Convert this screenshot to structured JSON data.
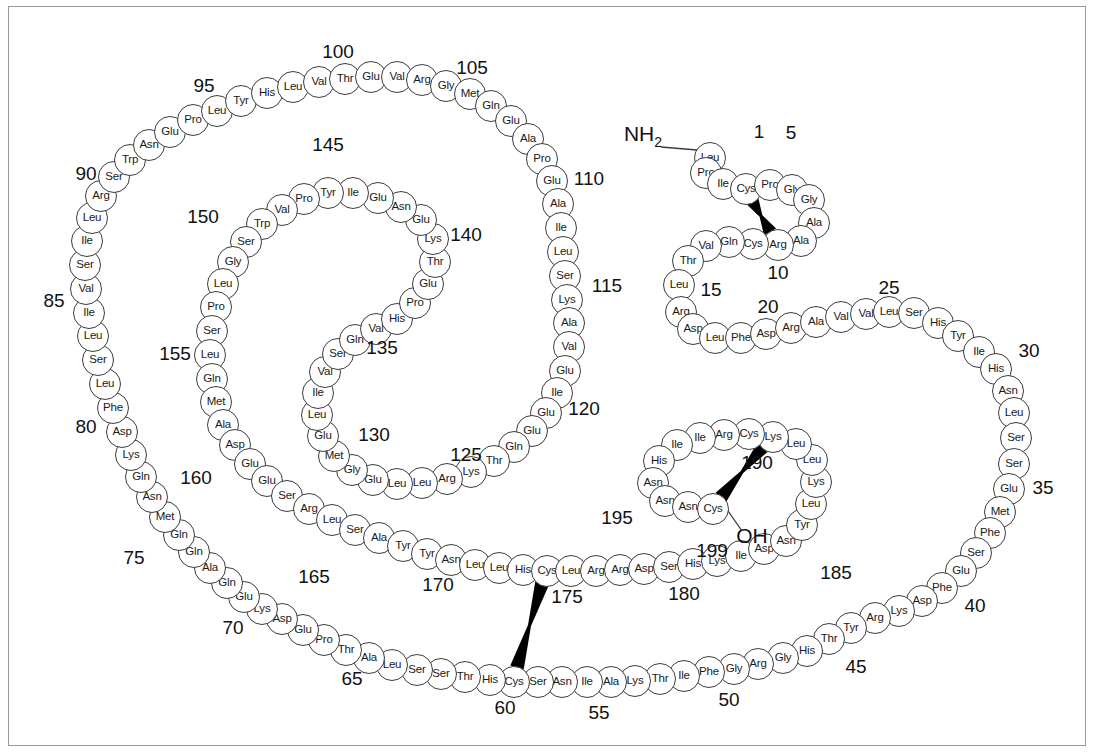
{
  "diagram": {
    "n_terminus_label": "NH2",
    "c_terminus_label": "OH",
    "residue_count": 199,
    "disulfide_bonds": [
      [
        4,
        10
      ],
      [
        58,
        174
      ],
      [
        190,
        199
      ]
    ],
    "stroke_color": "#3c3c3c",
    "bond_color": "#000000",
    "background": "#ffffff"
  },
  "sequence": [
    {
      "n": 1,
      "aa": "Leu",
      "x": 709,
      "y": 157
    },
    {
      "n": 2,
      "aa": "Pro",
      "x": 705,
      "y": 172
    },
    {
      "n": 3,
      "aa": "Ile",
      "x": 722,
      "y": 183
    },
    {
      "n": 4,
      "aa": "Cys",
      "x": 745,
      "y": 188
    },
    {
      "n": 5,
      "aa": "Pro",
      "x": 769,
      "y": 184
    },
    {
      "n": 6,
      "aa": "Gly",
      "x": 791,
      "y": 189
    },
    {
      "n": 7,
      "aa": "Gly",
      "x": 808,
      "y": 199
    },
    {
      "n": 8,
      "aa": "Ala",
      "x": 813,
      "y": 222
    },
    {
      "n": 9,
      "aa": "Ala",
      "x": 800,
      "y": 240
    },
    {
      "n": 10,
      "aa": "Arg",
      "x": 777,
      "y": 244
    },
    {
      "n": 11,
      "aa": "Cys",
      "x": 752,
      "y": 243
    },
    {
      "n": 12,
      "aa": "Gln",
      "x": 728,
      "y": 241
    },
    {
      "n": 13,
      "aa": "Val",
      "x": 705,
      "y": 245
    },
    {
      "n": 14,
      "aa": "Thr",
      "x": 687,
      "y": 260
    },
    {
      "n": 15,
      "aa": "Leu",
      "x": 678,
      "y": 284
    },
    {
      "n": 16,
      "aa": "Arg",
      "x": 680,
      "y": 311
    },
    {
      "n": 17,
      "aa": "Asp",
      "x": 692,
      "y": 328
    },
    {
      "n": 18,
      "aa": "Leu",
      "x": 714,
      "y": 337
    },
    {
      "n": 19,
      "aa": "Phe",
      "x": 740,
      "y": 337
    },
    {
      "n": 20,
      "aa": "Asp",
      "x": 765,
      "y": 333
    },
    {
      "n": 21,
      "aa": "Arg",
      "x": 790,
      "y": 327
    },
    {
      "n": 22,
      "aa": "Ala",
      "x": 815,
      "y": 321
    },
    {
      "n": 23,
      "aa": "Val",
      "x": 840,
      "y": 316
    },
    {
      "n": 24,
      "aa": "Val",
      "x": 865,
      "y": 313
    },
    {
      "n": 25,
      "aa": "Leu",
      "x": 888,
      "y": 311
    },
    {
      "n": 26,
      "aa": "Ser",
      "x": 913,
      "y": 312
    },
    {
      "n": 27,
      "aa": "His",
      "x": 937,
      "y": 322
    },
    {
      "n": 28,
      "aa": "Tyr",
      "x": 957,
      "y": 335
    },
    {
      "n": 29,
      "aa": "Ile",
      "x": 978,
      "y": 351
    },
    {
      "n": 30,
      "aa": "His",
      "x": 995,
      "y": 368
    },
    {
      "n": 31,
      "aa": "Asn",
      "x": 1007,
      "y": 390
    },
    {
      "n": 32,
      "aa": "Leu",
      "x": 1013,
      "y": 412
    },
    {
      "n": 33,
      "aa": "Ser",
      "x": 1015,
      "y": 437
    },
    {
      "n": 34,
      "aa": "Ser",
      "x": 1013,
      "y": 463
    },
    {
      "n": 35,
      "aa": "Glu",
      "x": 1008,
      "y": 488
    },
    {
      "n": 36,
      "aa": "Met",
      "x": 999,
      "y": 511
    },
    {
      "n": 37,
      "aa": "Phe",
      "x": 989,
      "y": 532
    },
    {
      "n": 38,
      "aa": "Ser",
      "x": 975,
      "y": 552
    },
    {
      "n": 39,
      "aa": "Glu",
      "x": 960,
      "y": 570
    },
    {
      "n": 40,
      "aa": "Phe",
      "x": 941,
      "y": 587
    },
    {
      "n": 41,
      "aa": "Asp",
      "x": 921,
      "y": 600
    },
    {
      "n": 42,
      "aa": "Lys",
      "x": 898,
      "y": 610
    },
    {
      "n": 43,
      "aa": "Arg",
      "x": 874,
      "y": 617
    },
    {
      "n": 44,
      "aa": "Tyr",
      "x": 850,
      "y": 627
    },
    {
      "n": 45,
      "aa": "Thr",
      "x": 828,
      "y": 638
    },
    {
      "n": 46,
      "aa": "His",
      "x": 806,
      "y": 650
    },
    {
      "n": 47,
      "aa": "Gly",
      "x": 782,
      "y": 657
    },
    {
      "n": 48,
      "aa": "Arg",
      "x": 757,
      "y": 663
    },
    {
      "n": 49,
      "aa": "Gly",
      "x": 733,
      "y": 668
    },
    {
      "n": 50,
      "aa": "Phe",
      "x": 708,
      "y": 671
    },
    {
      "n": 51,
      "aa": "Ile",
      "x": 683,
      "y": 675
    },
    {
      "n": 52,
      "aa": "Thr",
      "x": 659,
      "y": 678
    },
    {
      "n": 53,
      "aa": "Lys",
      "x": 634,
      "y": 680
    },
    {
      "n": 54,
      "aa": "Ala",
      "x": 610,
      "y": 681
    },
    {
      "n": 55,
      "aa": "Ile",
      "x": 586,
      "y": 681
    },
    {
      "n": 56,
      "aa": "Asn",
      "x": 561,
      "y": 681
    },
    {
      "n": 57,
      "aa": "Ser",
      "x": 537,
      "y": 681
    },
    {
      "n": 58,
      "aa": "Cys",
      "x": 513,
      "y": 681
    },
    {
      "n": 59,
      "aa": "His",
      "x": 489,
      "y": 679
    },
    {
      "n": 60,
      "aa": "Thr",
      "x": 464,
      "y": 676
    },
    {
      "n": 61,
      "aa": "Ser",
      "x": 440,
      "y": 673
    },
    {
      "n": 62,
      "aa": "Ser",
      "x": 416,
      "y": 669
    },
    {
      "n": 63,
      "aa": "Leu",
      "x": 391,
      "y": 664
    },
    {
      "n": 64,
      "aa": "Ala",
      "x": 368,
      "y": 657
    },
    {
      "n": 65,
      "aa": "Thr",
      "x": 345,
      "y": 649
    },
    {
      "n": 66,
      "aa": "Pro",
      "x": 323,
      "y": 639
    },
    {
      "n": 67,
      "aa": "Glu",
      "x": 302,
      "y": 629
    },
    {
      "n": 68,
      "aa": "Asp",
      "x": 281,
      "y": 618
    },
    {
      "n": 69,
      "aa": "Lys",
      "x": 261,
      "y": 608
    },
    {
      "n": 70,
      "aa": "Glu",
      "x": 243,
      "y": 596
    },
    {
      "n": 71,
      "aa": "Gln",
      "x": 226,
      "y": 582
    },
    {
      "n": 72,
      "aa": "Ala",
      "x": 209,
      "y": 567
    },
    {
      "n": 73,
      "aa": "Gln",
      "x": 193,
      "y": 551
    },
    {
      "n": 74,
      "aa": "Gln",
      "x": 178,
      "y": 534
    },
    {
      "n": 75,
      "aa": "Met",
      "x": 164,
      "y": 516
    },
    {
      "n": 76,
      "aa": "Asn",
      "x": 151,
      "y": 496
    },
    {
      "n": 77,
      "aa": "Gln",
      "x": 140,
      "y": 476
    },
    {
      "n": 78,
      "aa": "Lys",
      "x": 130,
      "y": 454
    },
    {
      "n": 79,
      "aa": "Asp",
      "x": 121,
      "y": 431
    },
    {
      "n": 80,
      "aa": "Phe",
      "x": 112,
      "y": 407
    },
    {
      "n": 81,
      "aa": "Leu",
      "x": 104,
      "y": 383
    },
    {
      "n": 82,
      "aa": "Ser",
      "x": 97,
      "y": 359
    },
    {
      "n": 83,
      "aa": "Leu",
      "x": 92,
      "y": 335
    },
    {
      "n": 84,
      "aa": "Ile",
      "x": 88,
      "y": 312
    },
    {
      "n": 85,
      "aa": "Val",
      "x": 85,
      "y": 288
    },
    {
      "n": 86,
      "aa": "Ser",
      "x": 84,
      "y": 264
    },
    {
      "n": 87,
      "aa": "Ile",
      "x": 86,
      "y": 240
    },
    {
      "n": 88,
      "aa": "Leu",
      "x": 91,
      "y": 217
    },
    {
      "n": 89,
      "aa": "Arg",
      "x": 100,
      "y": 195
    },
    {
      "n": 90,
      "aa": "Ser",
      "x": 113,
      "y": 176
    },
    {
      "n": 91,
      "aa": "Trp",
      "x": 129,
      "y": 159
    },
    {
      "n": 92,
      "aa": "Asn",
      "x": 148,
      "y": 144
    },
    {
      "n": 93,
      "aa": "Glu",
      "x": 169,
      "y": 131
    },
    {
      "n": 94,
      "aa": "Pro",
      "x": 192,
      "y": 119
    },
    {
      "n": 95,
      "aa": "Leu",
      "x": 216,
      "y": 110
    },
    {
      "n": 96,
      "aa": "Tyr",
      "x": 240,
      "y": 100
    },
    {
      "n": 97,
      "aa": "His",
      "x": 266,
      "y": 92
    },
    {
      "n": 98,
      "aa": "Leu",
      "x": 292,
      "y": 86
    },
    {
      "n": 99,
      "aa": "Val",
      "x": 318,
      "y": 81
    },
    {
      "n": 100,
      "aa": "Thr",
      "x": 344,
      "y": 78
    },
    {
      "n": 101,
      "aa": "Glu",
      "x": 370,
      "y": 76
    },
    {
      "n": 102,
      "aa": "Val",
      "x": 396,
      "y": 76
    },
    {
      "n": 103,
      "aa": "Arg",
      "x": 421,
      "y": 79
    },
    {
      "n": 104,
      "aa": "Gly",
      "x": 445,
      "y": 85
    },
    {
      "n": 105,
      "aa": "Met",
      "x": 469,
      "y": 93
    },
    {
      "n": 106,
      "aa": "Gln",
      "x": 490,
      "y": 105
    },
    {
      "n": 107,
      "aa": "Glu",
      "x": 510,
      "y": 120
    },
    {
      "n": 108,
      "aa": "Ala",
      "x": 527,
      "y": 138
    },
    {
      "n": 109,
      "aa": "Pro",
      "x": 541,
      "y": 158
    },
    {
      "n": 110,
      "aa": "Glu",
      "x": 551,
      "y": 180
    },
    {
      "n": 111,
      "aa": "Ala",
      "x": 557,
      "y": 203
    },
    {
      "n": 112,
      "aa": "Ile",
      "x": 560,
      "y": 227
    },
    {
      "n": 113,
      "aa": "Leu",
      "x": 562,
      "y": 251
    },
    {
      "n": 114,
      "aa": "Ser",
      "x": 564,
      "y": 275
    },
    {
      "n": 115,
      "aa": "Lys",
      "x": 566,
      "y": 299
    },
    {
      "n": 116,
      "aa": "Ala",
      "x": 568,
      "y": 322
    },
    {
      "n": 117,
      "aa": "Val",
      "x": 568,
      "y": 346
    },
    {
      "n": 118,
      "aa": "Glu",
      "x": 564,
      "y": 370
    },
    {
      "n": 119,
      "aa": "Ile",
      "x": 556,
      "y": 392
    },
    {
      "n": 120,
      "aa": "Glu",
      "x": 545,
      "y": 412
    },
    {
      "n": 121,
      "aa": "Glu",
      "x": 531,
      "y": 430
    },
    {
      "n": 122,
      "aa": "Gln",
      "x": 513,
      "y": 446
    },
    {
      "n": 123,
      "aa": "Thr",
      "x": 493,
      "y": 460
    },
    {
      "n": 124,
      "aa": "Lys",
      "x": 470,
      "y": 471
    },
    {
      "n": 125,
      "aa": "Arg",
      "x": 446,
      "y": 478
    },
    {
      "n": 126,
      "aa": "Leu",
      "x": 421,
      "y": 482
    },
    {
      "n": 127,
      "aa": "Leu",
      "x": 396,
      "y": 483
    },
    {
      "n": 128,
      "aa": "Glu",
      "x": 372,
      "y": 479
    },
    {
      "n": 129,
      "aa": "Gly",
      "x": 351,
      "y": 469
    },
    {
      "n": 130,
      "aa": "Met",
      "x": 333,
      "y": 455
    },
    {
      "n": 131,
      "aa": "Glu",
      "x": 322,
      "y": 435
    },
    {
      "n": 132,
      "aa": "Leu",
      "x": 316,
      "y": 414
    },
    {
      "n": 133,
      "aa": "Ile",
      "x": 317,
      "y": 392
    },
    {
      "n": 134,
      "aa": "Val",
      "x": 324,
      "y": 371
    },
    {
      "n": 135,
      "aa": "Ser",
      "x": 337,
      "y": 353
    },
    {
      "n": 136,
      "aa": "Gln",
      "x": 354,
      "y": 339
    },
    {
      "n": 137,
      "aa": "Val",
      "x": 375,
      "y": 328
    },
    {
      "n": 138,
      "aa": "His",
      "x": 396,
      "y": 318
    },
    {
      "n": 139,
      "aa": "Pro",
      "x": 414,
      "y": 302
    },
    {
      "n": 140,
      "aa": "Glu",
      "x": 427,
      "y": 283
    },
    {
      "n": 141,
      "aa": "Thr",
      "x": 434,
      "y": 261
    },
    {
      "n": 142,
      "aa": "Lys",
      "x": 432,
      "y": 238
    },
    {
      "n": 143,
      "aa": "Glu",
      "x": 420,
      "y": 219
    },
    {
      "n": 144,
      "aa": "Asn",
      "x": 400,
      "y": 206
    },
    {
      "n": 145,
      "aa": "Glu",
      "x": 377,
      "y": 197
    },
    {
      "n": 146,
      "aa": "Ile",
      "x": 352,
      "y": 192
    },
    {
      "n": 147,
      "aa": "Tyr",
      "x": 327,
      "y": 192
    },
    {
      "n": 148,
      "aa": "Pro",
      "x": 303,
      "y": 198
    },
    {
      "n": 149,
      "aa": "Val",
      "x": 281,
      "y": 209
    },
    {
      "n": 150,
      "aa": "Trp",
      "x": 261,
      "y": 223
    },
    {
      "n": 151,
      "aa": "Ser",
      "x": 245,
      "y": 241
    },
    {
      "n": 152,
      "aa": "Gly",
      "x": 232,
      "y": 261
    },
    {
      "n": 153,
      "aa": "Leu",
      "x": 222,
      "y": 283
    },
    {
      "n": 154,
      "aa": "Pro",
      "x": 215,
      "y": 306
    },
    {
      "n": 155,
      "aa": "Ser",
      "x": 211,
      "y": 330
    },
    {
      "n": 156,
      "aa": "Leu",
      "x": 209,
      "y": 354
    },
    {
      "n": 157,
      "aa": "Gln",
      "x": 211,
      "y": 378
    },
    {
      "n": 158,
      "aa": "Met",
      "x": 215,
      "y": 401
    },
    {
      "n": 159,
      "aa": "Ala",
      "x": 222,
      "y": 424
    },
    {
      "n": 160,
      "aa": "Asp",
      "x": 234,
      "y": 444
    },
    {
      "n": 161,
      "aa": "Glu",
      "x": 249,
      "y": 463
    },
    {
      "n": 162,
      "aa": "Glu",
      "x": 266,
      "y": 480
    },
    {
      "n": 163,
      "aa": "Ser",
      "x": 286,
      "y": 495
    },
    {
      "n": 164,
      "aa": "Arg",
      "x": 308,
      "y": 508
    },
    {
      "n": 165,
      "aa": "Leu",
      "x": 331,
      "y": 519
    },
    {
      "n": 166,
      "aa": "Ser",
      "x": 354,
      "y": 529
    },
    {
      "n": 167,
      "aa": "Ala",
      "x": 378,
      "y": 537
    },
    {
      "n": 168,
      "aa": "Tyr",
      "x": 402,
      "y": 545
    },
    {
      "n": 169,
      "aa": "Tyr",
      "x": 426,
      "y": 553
    },
    {
      "n": 170,
      "aa": "Asn",
      "x": 450,
      "y": 559
    },
    {
      "n": 171,
      "aa": "Leu",
      "x": 474,
      "y": 564
    },
    {
      "n": 172,
      "aa": "Leu",
      "x": 498,
      "y": 567
    },
    {
      "n": 173,
      "aa": "His",
      "x": 522,
      "y": 569
    },
    {
      "n": 174,
      "aa": "Cys",
      "x": 546,
      "y": 570
    },
    {
      "n": 175,
      "aa": "Leu",
      "x": 570,
      "y": 570
    },
    {
      "n": 176,
      "aa": "Arg",
      "x": 595,
      "y": 570
    },
    {
      "n": 177,
      "aa": "Arg",
      "x": 619,
      "y": 569
    },
    {
      "n": 178,
      "aa": "Asp",
      "x": 643,
      "y": 568
    },
    {
      "n": 179,
      "aa": "Ser",
      "x": 668,
      "y": 566
    },
    {
      "n": 180,
      "aa": "His",
      "x": 692,
      "y": 563
    },
    {
      "n": 181,
      "aa": "Lys",
      "x": 716,
      "y": 560
    },
    {
      "n": 182,
      "aa": "Ile",
      "x": 740,
      "y": 555
    },
    {
      "n": 183,
      "aa": "Asp",
      "x": 763,
      "y": 548
    },
    {
      "n": 184,
      "aa": "Asn",
      "x": 785,
      "y": 540
    },
    {
      "n": 185,
      "aa": "Tyr",
      "x": 801,
      "y": 524
    },
    {
      "n": 186,
      "aa": "Leu",
      "x": 810,
      "y": 503
    },
    {
      "n": 187,
      "aa": "Lys",
      "x": 815,
      "y": 481
    },
    {
      "n": 188,
      "aa": "Leu",
      "x": 811,
      "y": 459
    },
    {
      "n": 189,
      "aa": "Leu",
      "x": 795,
      "y": 443
    },
    {
      "n": 190,
      "aa": "Lys",
      "x": 772,
      "y": 436
    },
    {
      "n": 191,
      "aa": "Cys",
      "x": 748,
      "y": 433
    },
    {
      "n": 192,
      "aa": "Arg",
      "x": 723,
      "y": 434
    },
    {
      "n": 193,
      "aa": "Ile",
      "x": 699,
      "y": 437
    },
    {
      "n": 194,
      "aa": "Ile",
      "x": 676,
      "y": 444
    },
    {
      "n": 195,
      "aa": "His",
      "x": 658,
      "y": 460
    },
    {
      "n": 196,
      "aa": "Asn",
      "x": 652,
      "y": 482
    },
    {
      "n": 197,
      "aa": "Asn",
      "x": 664,
      "y": 500
    },
    {
      "n": 198,
      "aa": "Asn",
      "x": 687,
      "y": 506
    },
    {
      "n": 199,
      "aa": "Cys",
      "x": 712,
      "y": 508
    }
  ],
  "number_labels": [
    {
      "text": "1",
      "x": 759,
      "y": 132
    },
    {
      "text": "5",
      "x": 791,
      "y": 133
    },
    {
      "text": "10",
      "x": 778,
      "y": 273
    },
    {
      "text": "15",
      "x": 711,
      "y": 290
    },
    {
      "text": "20",
      "x": 768,
      "y": 307
    },
    {
      "text": "25",
      "x": 889,
      "y": 288
    },
    {
      "text": "30",
      "x": 1029,
      "y": 351
    },
    {
      "text": "35",
      "x": 1043,
      "y": 488
    },
    {
      "text": "40",
      "x": 975,
      "y": 606
    },
    {
      "text": "45",
      "x": 856,
      "y": 667
    },
    {
      "text": "50",
      "x": 729,
      "y": 700
    },
    {
      "text": "55",
      "x": 599,
      "y": 713
    },
    {
      "text": "60",
      "x": 505,
      "y": 708
    },
    {
      "text": "65",
      "x": 352,
      "y": 679
    },
    {
      "text": "70",
      "x": 233,
      "y": 628
    },
    {
      "text": "75",
      "x": 134,
      "y": 558
    },
    {
      "text": "80",
      "x": 86,
      "y": 427
    },
    {
      "text": "85",
      "x": 54,
      "y": 301
    },
    {
      "text": "90",
      "x": 86,
      "y": 174
    },
    {
      "text": "95",
      "x": 204,
      "y": 86
    },
    {
      "text": "100",
      "x": 338,
      "y": 52
    },
    {
      "text": "105",
      "x": 472,
      "y": 68
    },
    {
      "text": "110",
      "x": 589,
      "y": 179
    },
    {
      "text": "115",
      "x": 607,
      "y": 286
    },
    {
      "text": "120",
      "x": 584,
      "y": 409
    },
    {
      "text": "125",
      "x": 466,
      "y": 455
    },
    {
      "text": "130",
      "x": 374,
      "y": 435
    },
    {
      "text": "135",
      "x": 382,
      "y": 348
    },
    {
      "text": "140",
      "x": 466,
      "y": 235
    },
    {
      "text": "145",
      "x": 328,
      "y": 145
    },
    {
      "text": "150",
      "x": 203,
      "y": 217
    },
    {
      "text": "155",
      "x": 175,
      "y": 354
    },
    {
      "text": "160",
      "x": 196,
      "y": 478
    },
    {
      "text": "165",
      "x": 314,
      "y": 577
    },
    {
      "text": "170",
      "x": 438,
      "y": 585
    },
    {
      "text": "175",
      "x": 567,
      "y": 597
    },
    {
      "text": "180",
      "x": 684,
      "y": 594
    },
    {
      "text": "185",
      "x": 836,
      "y": 573
    },
    {
      "text": "190",
      "x": 757,
      "y": 463
    },
    {
      "text": "195",
      "x": 617,
      "y": 518
    },
    {
      "text": "199",
      "x": 712,
      "y": 551
    }
  ],
  "termini": [
    {
      "id": "n-terminus",
      "text": "NH",
      "sub": "2",
      "x": 643,
      "y": 136
    },
    {
      "id": "c-terminus",
      "text": "OH",
      "sub": "",
      "x": 752,
      "y": 536
    }
  ]
}
